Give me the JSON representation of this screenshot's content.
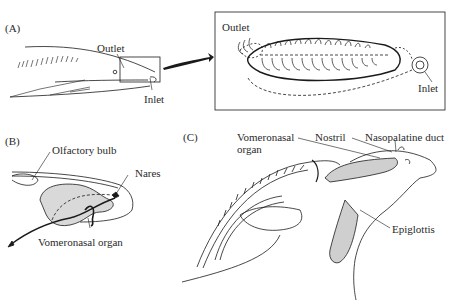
{
  "figure": {
    "panels": [
      {
        "id": "A",
        "label": "(A)",
        "labels": {
          "outlet": "Outlet",
          "inlet": "Inlet"
        },
        "inset": {
          "labels": {
            "outlet": "Outlet",
            "inlet": "Inlet"
          }
        }
      },
      {
        "id": "B",
        "label": "(B)",
        "labels": {
          "olfactory_bulb": "Olfactory bulb",
          "nares": "Nares",
          "vomeronasal_organ": "Vomeronasal organ"
        }
      },
      {
        "id": "C",
        "label": "(C)",
        "labels": {
          "vomeronasal_line1": "Vomeronasal",
          "vomeronasal_line2": "organ",
          "nostril": "Nostril",
          "nasopalatine_duct": "Nasopalatine duct",
          "epiglottis": "Epiglottis"
        }
      }
    ],
    "colors": {
      "line": "#1a1a1a",
      "stipple": "#c8c8c8",
      "background": "#ffffff"
    }
  }
}
